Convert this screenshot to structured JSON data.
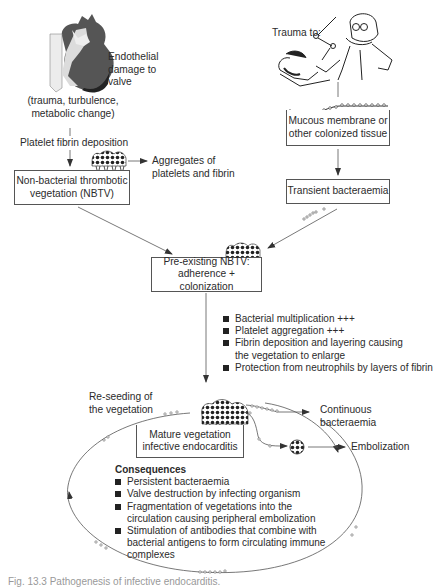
{
  "diagram": {
    "type": "flowchart",
    "left_branch": {
      "heart_label": [
        "Endothelial",
        "damage to",
        "valve"
      ],
      "causes": [
        "(trauma, turbulence,",
        "metabolic change)"
      ],
      "step": "Platelet fibrin deposition",
      "nbtv_box": [
        "Non-bacterial thrombotic",
        "vegetation (NBTV)"
      ],
      "aggregates_label": [
        "Aggregates of",
        "platelets and fibrin"
      ]
    },
    "right_branch": {
      "trauma_label": "Trauma to:",
      "mucous_box": [
        "Mucous membrane or",
        "other colonized tissue"
      ],
      "bacteraemia_box": "Transient bacteraemia"
    },
    "preexisting_box": [
      "Pre-existing NBTV:",
      "adherence + colonization"
    ],
    "growth_factors": [
      "Bacterial multiplication +++",
      "Platelet aggregation +++",
      "Fibrin deposition and layering causing",
      "the vegetation to enlarge",
      "Protection from neutrophils by layers of fibrin"
    ],
    "reseeding_label": [
      "Re-seeding of",
      "the vegetation"
    ],
    "mature_box": [
      "Mature vegetation",
      "infective endocarditis"
    ],
    "continuous_label": [
      "Continuous",
      "bacteraemia"
    ],
    "embolization_label": "Embolization",
    "consequences": {
      "title": "Consequences",
      "items": [
        "Persistent bacteraemia",
        "Valve destruction by infecting organism",
        "Fragmentation of vegetations into the",
        "circulation causing peripheral embolization",
        "Stimulation of antibodies that combine with",
        "bacterial antigens to form circulating immune",
        "complexes"
      ]
    },
    "caption": "Fig. 13.3  Pathogenesis of infective endocarditis.",
    "colors": {
      "line": "#555555",
      "text": "#2b2b2b",
      "heart_dark": "#444444",
      "heart_light": "#e8e8e8"
    }
  }
}
